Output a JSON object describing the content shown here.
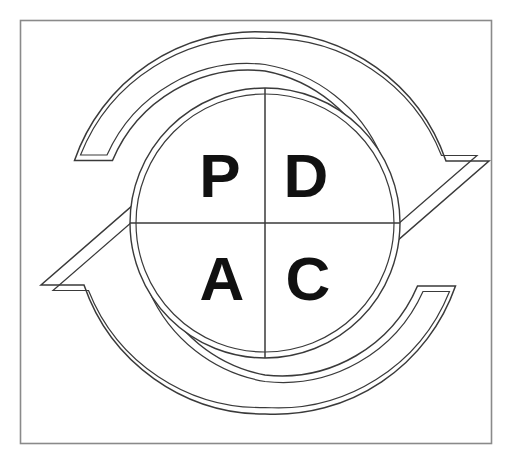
{
  "diagram": {
    "name": "PDCA Cycle",
    "type": "cycle-diagram",
    "frame": {
      "visible": true,
      "stroke_color": "#8a8a8a"
    },
    "colors": {
      "outline": "#3a3a3a",
      "fill": "#ffffff",
      "letter": "#111111",
      "frame": "#8a8a8a"
    },
    "wheel": {
      "center_x": 265,
      "center_y": 223,
      "radius": 135,
      "quadrants": [
        {
          "id": "plan",
          "letter": "P",
          "position": "top-left",
          "x": 220,
          "y": 197
        },
        {
          "id": "do",
          "letter": "D",
          "position": "top-right",
          "x": 306,
          "y": 197
        },
        {
          "id": "act",
          "letter": "A",
          "position": "bottom-left",
          "x": 222,
          "y": 300
        },
        {
          "id": "check",
          "letter": "C",
          "position": "bottom-right",
          "x": 308,
          "y": 300
        }
      ]
    },
    "arrows": [
      {
        "id": "upper-arrow",
        "direction": "clockwise",
        "tail_position": "left",
        "head_position": "right",
        "head_points": "down-right"
      },
      {
        "id": "lower-arrow",
        "direction": "clockwise",
        "tail_position": "right",
        "head_position": "left",
        "head_points": "up-left"
      }
    ]
  }
}
